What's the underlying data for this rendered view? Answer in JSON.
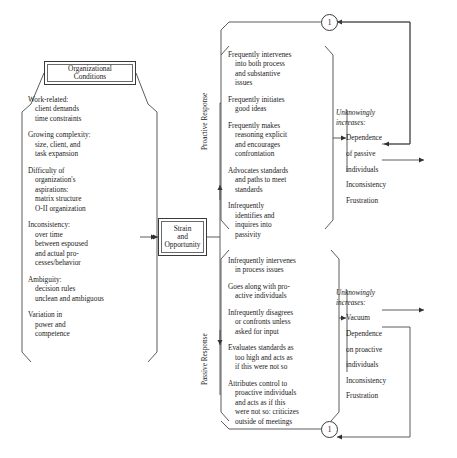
{
  "diagram": {
    "type": "flowchart"
  },
  "org_header": {
    "line1": "Organizational",
    "line2": "Conditions"
  },
  "conditions": [
    {
      "first": "Work-related:",
      "indented": [
        "client demands",
        "time constraints"
      ]
    },
    {
      "first": "Growing complexity:",
      "indented": [
        "size, client, and",
        "task expansion"
      ]
    },
    {
      "first": "Difficulty of",
      "indented": [
        "organization's",
        "aspirations:",
        "matrix structure",
        "O-II organization"
      ]
    },
    {
      "first": "Inconsistency:",
      "indented": [
        "over time",
        "between espoused",
        "and actual pro-",
        "cesses/behavior"
      ]
    },
    {
      "first": "Ambiguity:",
      "indented": [
        "decision rules",
        "unclean and ambiguous"
      ]
    },
    {
      "first": "Variation in",
      "indented": [
        "power and",
        "competence"
      ]
    }
  ],
  "strain_box": {
    "line1": "Strain",
    "line2": "and",
    "line3": "Opportunity"
  },
  "labels": {
    "proactive": "Proactive Response",
    "passive": "Passive Response"
  },
  "proactive_items": [
    {
      "first": "Frequently intervenes",
      "indented": [
        "into both process",
        "and substantive",
        "issues"
      ]
    },
    {
      "first": "Frequently initiates",
      "indented": [
        "good ideas"
      ]
    },
    {
      "first": "Frequently makes",
      "indented": [
        "reasoning explicit",
        "and encourages",
        "confrontation"
      ]
    },
    {
      "first": "Advocates standards",
      "indented": [
        "and paths to meet",
        "standards"
      ]
    },
    {
      "first": "Infrequently",
      "indented": [
        "identifies and",
        "inquires into",
        "passivity"
      ]
    }
  ],
  "passive_items": [
    {
      "first": "Infrequently intervenes",
      "indented": [
        "in process issues"
      ]
    },
    {
      "first": "Goes along with pro-",
      "indented": [
        "active individuals"
      ]
    },
    {
      "first": "Infrequently disagrees",
      "indented": [
        "or confronts unless",
        "asked for input"
      ]
    },
    {
      "first": "Evaluates standards as",
      "indented": [
        "too high and acts as",
        "if this were not so"
      ]
    },
    {
      "first": "Attributes control to",
      "indented": [
        "proactive individuals",
        "and acts as if this",
        "were not so: criticizes",
        "outside of meetings"
      ]
    }
  ],
  "consequences_top": {
    "head_line1": "Unknowingly",
    "head_line2": "increases:",
    "items": [
      "Dependence\nof passive\nindividuals",
      "Inconsistency",
      "Frustration"
    ],
    "item1_lines": [
      "Dependence",
      "of passive",
      "individuals"
    ],
    "item2": "Inconsistency",
    "item3": "Frustration"
  },
  "consequences_bottom": {
    "head_line1": "Unknowingly",
    "head_line2": "increases:",
    "item1": "Vacuum",
    "item2_lines": [
      "Dependence",
      "on proactive",
      "individuals"
    ],
    "item3": "Inconsistency",
    "item4": "Frustration"
  },
  "connectors": {
    "circle_top_label": "1",
    "circle_bottom_label": "1"
  },
  "colors": {
    "stroke": "#3a3a3a",
    "text": "#1a1a1a",
    "background": "#ffffff"
  }
}
